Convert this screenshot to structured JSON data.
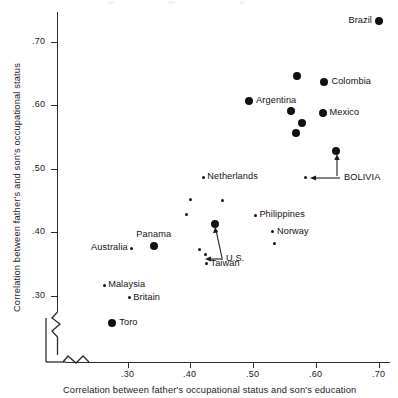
{
  "chart_data": {
    "type": "scatter",
    "title": "",
    "xlabel": "Correlation between father's occupational status and son's education",
    "ylabel": "Correlation between father's and son's occupational status",
    "xlim": [
      0.225,
      0.715
    ],
    "ylim": [
      0.255,
      0.745
    ],
    "xticks": [
      ".30",
      ".40",
      ".50",
      ".60",
      ".70"
    ],
    "xtick_values": [
      0.3,
      0.4,
      0.5,
      0.6,
      0.7
    ],
    "yticks": [
      ".30",
      ".40",
      ".50",
      ".60",
      ".70"
    ],
    "ytick_values": [
      0.3,
      0.4,
      0.5,
      0.6,
      0.7
    ],
    "grid": false,
    "legend": null,
    "axis_break_x": true,
    "axis_break_y": true,
    "marker_colors": {
      "point": "#111111"
    },
    "points": [
      {
        "label": "Brazil",
        "x": 0.7,
        "y": 0.733,
        "size": "big",
        "label_side": "left"
      },
      {
        "label": "Colombia",
        "x": 0.613,
        "y": 0.637,
        "size": "big",
        "label_side": "right"
      },
      {
        "label": "",
        "x": 0.569,
        "y": 0.647,
        "size": "big",
        "label_side": "right"
      },
      {
        "label": "Argentina",
        "x": 0.493,
        "y": 0.607,
        "size": "big",
        "label_side": "right"
      },
      {
        "label": "",
        "x": 0.56,
        "y": 0.592,
        "size": "big",
        "label_side": "right"
      },
      {
        "label": "Mexico",
        "x": 0.61,
        "y": 0.588,
        "size": "big",
        "label_side": "right"
      },
      {
        "label": "",
        "x": 0.577,
        "y": 0.573,
        "size": "big",
        "label_side": "right"
      },
      {
        "label": "",
        "x": 0.568,
        "y": 0.556,
        "size": "big",
        "label_side": "right"
      },
      {
        "label": "BOLIVIA",
        "x": 0.632,
        "y": 0.528,
        "size": "big",
        "label_side": "annot"
      },
      {
        "label": "",
        "x": 0.583,
        "y": 0.487,
        "size": "small",
        "label_side": "annot"
      },
      {
        "label": "Netherlands",
        "x": 0.42,
        "y": 0.487,
        "size": "small",
        "label_side": "right"
      },
      {
        "label": "",
        "x": 0.4,
        "y": 0.452,
        "size": "small",
        "label_side": "right"
      },
      {
        "label": "",
        "x": 0.45,
        "y": 0.45,
        "size": "small",
        "label_side": "right"
      },
      {
        "label": "",
        "x": 0.393,
        "y": 0.429,
        "size": "small",
        "label_side": "right"
      },
      {
        "label": "Philippines",
        "x": 0.503,
        "y": 0.427,
        "size": "small",
        "label_side": "right"
      },
      {
        "label": "",
        "x": 0.438,
        "y": 0.414,
        "size": "big",
        "label_side": "annot"
      },
      {
        "label": "Norway",
        "x": 0.531,
        "y": 0.401,
        "size": "small",
        "label_side": "right"
      },
      {
        "label": "",
        "x": 0.533,
        "y": 0.382,
        "size": "small",
        "label_side": "right"
      },
      {
        "label": "Panama",
        "x": 0.342,
        "y": 0.378,
        "size": "big",
        "label_side": "above"
      },
      {
        "label": "Australia",
        "x": 0.306,
        "y": 0.375,
        "size": "small",
        "label_side": "left"
      },
      {
        "label": "",
        "x": 0.414,
        "y": 0.373,
        "size": "small",
        "label_side": "right"
      },
      {
        "label": "U.S.",
        "x": 0.424,
        "y": 0.365,
        "size": "small",
        "label_side": "annot"
      },
      {
        "label": "Taiwan",
        "x": 0.425,
        "y": 0.351,
        "size": "small",
        "label_side": "right"
      },
      {
        "label": "Malaysia",
        "x": 0.262,
        "y": 0.317,
        "size": "small",
        "label_side": "right"
      },
      {
        "label": "Britain",
        "x": 0.302,
        "y": 0.297,
        "size": "small",
        "label_side": "right"
      },
      {
        "label": "Toro",
        "x": 0.275,
        "y": 0.258,
        "size": "big",
        "label_side": "right"
      }
    ],
    "annotations": [
      {
        "text": "BOLIVIA",
        "targets": [
          "bolivia-upper",
          "bolivia-lower"
        ]
      },
      {
        "text": "U.S.",
        "targets": [
          "us-upper",
          "us-lower"
        ]
      }
    ]
  }
}
